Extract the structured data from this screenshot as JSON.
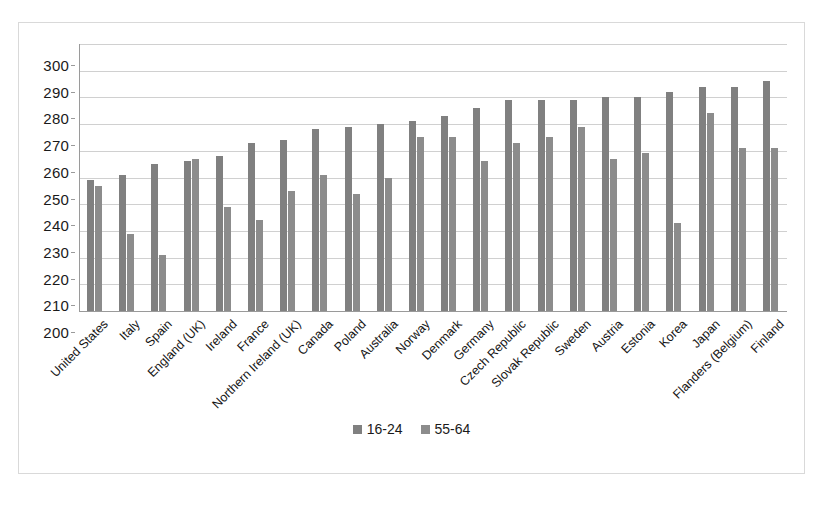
{
  "chart_data": {
    "type": "bar",
    "title": "",
    "subtitle": "",
    "xlabel": "",
    "ylabel": "",
    "ylim": [
      200,
      300
    ],
    "ytick_step": 10,
    "yticks": [
      300,
      290,
      280,
      270,
      260,
      250,
      240,
      230,
      220,
      210,
      200
    ],
    "grid": true,
    "legend_position": "bottom",
    "categories": [
      "United States",
      "Italy",
      "Spain",
      "England (UK)",
      "Ireland",
      "France",
      "Northern Ireland (UK)",
      "Canada",
      "Poland",
      "Australia",
      "Norway",
      "Denmark",
      "Germany",
      "Czech Republic",
      "Slovak Republic",
      "Sweden",
      "Austria",
      "Estonia",
      "Korea",
      "Japan",
      "Flanders (Belgium)",
      "Finland"
    ],
    "series": [
      {
        "name": "16-24",
        "color": "#808080",
        "values": [
          249,
          251,
          255,
          256,
          258,
          263,
          264,
          268,
          269,
          270,
          271,
          273,
          276,
          279,
          279,
          279,
          280,
          280,
          282,
          284,
          284,
          286
        ]
      },
      {
        "name": "55-64",
        "color": "#8c8c8c",
        "values": [
          247,
          229,
          221,
          257,
          239,
          234,
          245,
          251,
          244,
          250,
          265,
          265,
          256,
          263,
          265,
          269,
          257,
          259,
          233,
          274,
          261,
          261
        ]
      }
    ]
  },
  "legend": {
    "items": [
      {
        "label": "16-24",
        "color": "#808080"
      },
      {
        "label": "55-64",
        "color": "#8c8c8c"
      }
    ]
  },
  "style": {
    "background": "#ffffff",
    "border": "#d9d9d9",
    "gridline": "#d0d0d0",
    "axis": "#9a9a9a",
    "text": "#1a1a1a"
  }
}
